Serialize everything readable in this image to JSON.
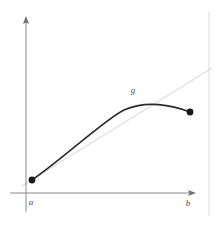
{
  "figure": {
    "background_color": "#ffffff",
    "width": 218,
    "height": 225
  },
  "axes": {
    "color": "#8a8a8a",
    "x_axis": {
      "name": "horizontal-axis",
      "x_start": 10,
      "x_end": 196,
      "y": 193,
      "has_arrow": true
    },
    "y_axis": {
      "name": "vertical-axis",
      "x": 26,
      "y_start": 18,
      "y_end": 212,
      "has_arrow": true
    }
  },
  "tick_labels": {
    "a": "a",
    "b": "b",
    "a_position": {
      "x": 31,
      "y": 205
    },
    "b_position": {
      "x": 188,
      "y": 206
    }
  },
  "curve": {
    "name": "function-curve-g",
    "label": "g",
    "label_position": {
      "x": 133,
      "y": 93
    },
    "color": "#2b2b2b",
    "stroke_width": 1.6,
    "path": "M 32,180 C 64,158 104,120 124,110 C 146,100 172,105 190,112"
  },
  "endpoints": {
    "color": "#1a1a1a",
    "radius": 3.4,
    "left": {
      "name": "endpoint-a",
      "x": 32,
      "y": 180
    },
    "right": {
      "name": "endpoint-b",
      "x": 190,
      "y": 112
    }
  },
  "chord_line": {
    "name": "secant-chord-line",
    "color": "#dedede",
    "stroke_width": 1.2,
    "x1": 22,
    "y1": 186,
    "x2": 212,
    "y2": 68
  },
  "frame": {
    "right_rule": {
      "name": "right-vertical-rule",
      "color": "#dadada",
      "x": 209,
      "y_start": 12,
      "y_end": 216
    }
  },
  "chart_data": {
    "type": "line",
    "title": "",
    "xlabel": "",
    "ylabel": "",
    "grid": false,
    "legend": "none",
    "annotations": [
      {
        "text": "g",
        "x": 124,
        "y": 110,
        "note": "curve name label placed above apex of curve"
      },
      {
        "text": "a",
        "x": 32,
        "y": 193,
        "note": "left interval endpoint on x-axis"
      },
      {
        "text": "b",
        "x": 190,
        "y": 193,
        "note": "right interval endpoint on x-axis"
      }
    ],
    "series": [
      {
        "name": "g",
        "style": "solid-curve",
        "color": "#2b2b2b",
        "description": "concave-down curve rising from (a, low) to an interior maximum then descending slightly to (b, high)",
        "x": [
          32,
          52,
          72,
          92,
          112,
          132,
          152,
          172,
          190
        ],
        "y": [
          180,
          162,
          146,
          132,
          119,
          110,
          105,
          105,
          112
        ],
        "markers_at_endpoints": true
      },
      {
        "name": "chord",
        "style": "faint-straight-line",
        "color": "#dedede",
        "description": "light straight line through the two endpoints, extended beyond both",
        "x": [
          22,
          212
        ],
        "y": [
          186,
          68
        ],
        "markers_at_endpoints": false
      }
    ],
    "xlim": [
      10,
      196
    ],
    "ylim": [
      193,
      18
    ]
  }
}
